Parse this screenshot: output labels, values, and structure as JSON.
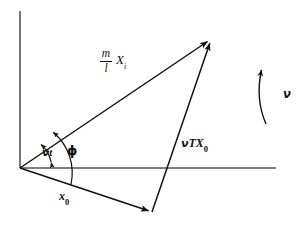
{
  "figure": {
    "type": "vector-diagram",
    "background_color": "#ffffff",
    "stroke_color": "#111111",
    "axis_color": "#555555"
  },
  "labels": {
    "vector_mlxi": {
      "numerator": "m",
      "denominator": "l",
      "symbol": "X",
      "subscript": "i"
    },
    "vector_nutx0": {
      "nu": "ν",
      "body": "TX",
      "subscript": "0"
    },
    "angle_nut": {
      "nu": "ν",
      "body": "t"
    },
    "angle_phi": {
      "symbol": "ϕ"
    },
    "vector_x0": {
      "symbol": "x",
      "subscript": "0"
    },
    "rotation_nu": {
      "symbol": "ν"
    }
  },
  "geometry": {
    "origin": {
      "x": 20,
      "y": 168
    },
    "vertical_axis": {
      "x1": 20,
      "y1": 11,
      "x2": 20,
      "y2": 168
    },
    "horizontal_axis": {
      "x1": 20,
      "y1": 168,
      "x2": 276,
      "y2": 168
    },
    "vector_mlxi_line": {
      "x1": 20,
      "y1": 168,
      "x2": 212,
      "y2": 38
    },
    "vector_x0_line": {
      "x1": 20,
      "y1": 168,
      "x2": 152,
      "y2": 212
    },
    "vector_nutx0_line": {
      "x1": 152,
      "y1": 212,
      "x2": 212,
      "y2": 38
    },
    "arc_nut_radius": 34,
    "arc_phi_radius": 53,
    "rotation_arrow": {
      "x": 262,
      "y_top": 66,
      "y_bottom": 124
    }
  }
}
